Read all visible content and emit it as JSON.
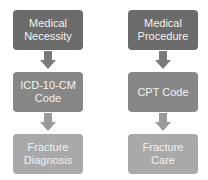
{
  "diagram": {
    "colors": {
      "level1": "#6b6b6b",
      "level2": "#878787",
      "level3": "#a9a9a9",
      "arrow1": "#7a7a7a",
      "arrow2": "#9a9a9a"
    },
    "columns": [
      {
        "nodes": [
          {
            "label": "Medical\nNecessity"
          },
          {
            "label": "ICD-10-CM\nCode"
          },
          {
            "label": "Fracture\nDiagnosis"
          }
        ]
      },
      {
        "nodes": [
          {
            "label": "Medical\nProcedure"
          },
          {
            "label": "CPT Code"
          },
          {
            "label": "Fracture\nCare"
          }
        ]
      }
    ]
  }
}
